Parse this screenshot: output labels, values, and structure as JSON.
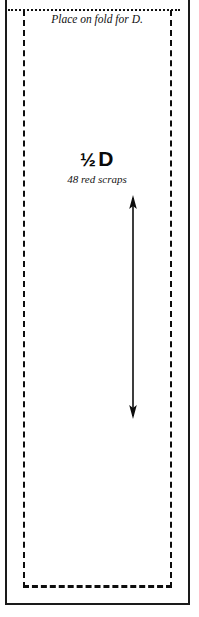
{
  "document": {
    "type": "quilt-pattern-template",
    "orientation": "portrait"
  },
  "fold_instruction": {
    "text": "Place on fold for D."
  },
  "piece_label": {
    "fraction": "½",
    "piece_letter": "D",
    "full_name": "½ D",
    "note": "48 red scraps",
    "quantity": 48,
    "fabric": "red scraps"
  },
  "grain_arrow": {
    "name": "grain-direction-arrow",
    "direction": "vertical-double-headed"
  },
  "lines": {
    "fold_line_style": "dotted",
    "cut_line_style": "dashed",
    "frame_style": "solid"
  },
  "colors": {
    "ink": "#0d0d0d",
    "paper": "#ffffff"
  }
}
